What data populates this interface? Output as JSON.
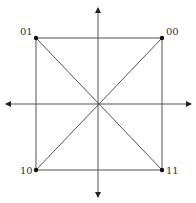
{
  "diagram": {
    "type": "constellation",
    "points": [
      {
        "label": "01",
        "position": "top-left"
      },
      {
        "label": "00",
        "position": "top-right"
      },
      {
        "label": "10",
        "position": "bottom-left"
      },
      {
        "label": "11",
        "position": "bottom-right"
      }
    ],
    "colors": {
      "line": "#555555",
      "dot": "#111111",
      "text": "#333333"
    }
  }
}
